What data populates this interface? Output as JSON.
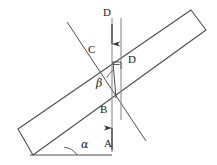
{
  "figure": {
    "kind": "optics-ray-diagram",
    "stroke_color": "#4d4d4d",
    "label_color": "#1a1a1a",
    "background_color": "#ffffff",
    "width": 217,
    "height": 165
  },
  "labels": {
    "ray_incident": "A",
    "ray_inside": "B",
    "ray_emergent": "C",
    "normal_top": "D",
    "normal_mid": "D",
    "angle_alpha": "α",
    "angle_beta": "β"
  },
  "geometry": {
    "slab": {
      "note": "inclined rectangular slab",
      "corners": [
        [
          18,
          129
        ],
        [
          33,
          155
        ],
        [
          206,
          30
        ],
        [
          191,
          10
        ]
      ]
    },
    "baseline": {
      "from": [
        30,
        155
      ],
      "to": [
        110,
        155
      ]
    },
    "slab_lower_face_line": {
      "from": [
        22,
        148
      ],
      "to": [
        207,
        16
      ]
    },
    "oblique_ray_line": {
      "from": [
        67,
        22
      ],
      "to": [
        146,
        141
      ]
    },
    "vertical_arrow_line": {
      "x": 112,
      "from_y": 18,
      "to_y": 150
    },
    "vertical_plain_line": {
      "x": 121,
      "from_y": 18,
      "to_y": 120
    },
    "intersection_upper": [
      113,
      62
    ],
    "intersection_lower": [
      116,
      98
    ],
    "angle_alpha_vertex": [
      62,
      155
    ],
    "angle_beta_vertex": [
      116,
      98
    ],
    "right_angle_marker": [
      113,
      62
    ]
  },
  "label_positions": {
    "ray_incident": [
      106,
      141
    ],
    "ray_inside": [
      102,
      108
    ],
    "ray_emergent": [
      91,
      49
    ],
    "normal_top": [
      103,
      12
    ],
    "normal_mid": [
      128,
      58
    ],
    "angle_alpha": [
      71,
      140
    ],
    "angle_beta": [
      98,
      83
    ]
  }
}
